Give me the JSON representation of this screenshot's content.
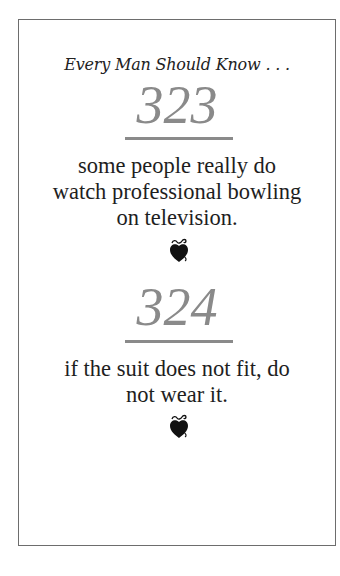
{
  "header": {
    "title": "Every Man Should Know . . ."
  },
  "entries": [
    {
      "number": "323",
      "text_lines": [
        "some people really do",
        "watch professional bowling",
        "on television."
      ],
      "ornament": "heart-apple-icon"
    },
    {
      "number": "324",
      "text_lines": [
        "if the suit does not fit, do",
        "not wear it."
      ],
      "ornament": "heart-apple-icon"
    }
  ],
  "colors": {
    "number": "#8a8a8a",
    "border": "#6d6d6d",
    "text": "#1e1e1e"
  }
}
